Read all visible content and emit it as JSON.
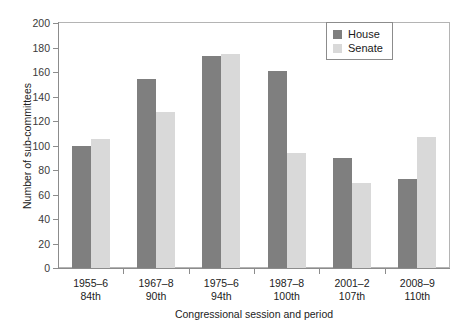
{
  "chart_data": {
    "type": "bar",
    "title": "",
    "xlabel": "Congressional session and period",
    "ylabel": "Number of sub-committees",
    "ylim": [
      0,
      200
    ],
    "ytick_step": 20,
    "yticks": [
      0,
      20,
      40,
      60,
      80,
      100,
      120,
      140,
      160,
      180,
      200
    ],
    "grid": false,
    "legend_position": "top-right",
    "categories": [
      "1955–6 84th",
      "1967–8 90th",
      "1975–6 94th",
      "1987–8 100th",
      "2001–2 107th",
      "2008–9 110th"
    ],
    "category_lines": [
      {
        "period": "1955–6",
        "session": "84th"
      },
      {
        "period": "1967–8",
        "session": "90th"
      },
      {
        "period": "1975–6",
        "session": "94th"
      },
      {
        "period": "1987–8",
        "session": "100th"
      },
      {
        "period": "2001–2",
        "session": "107th"
      },
      {
        "period": "2008–9",
        "session": "110th"
      }
    ],
    "series": [
      {
        "name": "House",
        "color": "#7f7f7f",
        "values": [
          100,
          154,
          173,
          161,
          90,
          73
        ]
      },
      {
        "name": "Senate",
        "color": "#d9d9d9",
        "values": [
          105,
          127,
          175,
          94,
          69,
          107
        ]
      }
    ]
  },
  "legend": {
    "items": [
      {
        "label": "House",
        "color": "#7f7f7f"
      },
      {
        "label": "Senate",
        "color": "#d9d9d9"
      }
    ]
  },
  "axes": {
    "y_title": "Number of sub-committees",
    "x_title": "Congressional session and period",
    "y_tick_labels": [
      "0",
      "20",
      "40",
      "60",
      "80",
      "100",
      "120",
      "140",
      "160",
      "180",
      "200"
    ]
  }
}
